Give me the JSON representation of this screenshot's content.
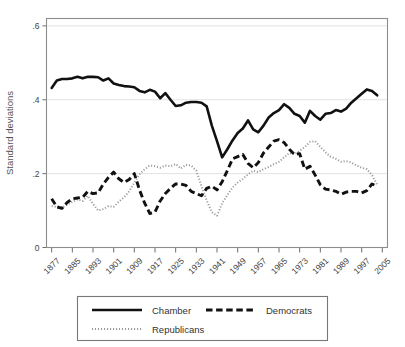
{
  "figure": {
    "width": 405,
    "height": 347,
    "background": "#ffffff"
  },
  "axes": {
    "ylabel": "Standard deviations",
    "xlabel": "",
    "ytick_labels": [
      "0",
      ".2",
      ".4",
      ".6"
    ],
    "ytick_values": [
      0,
      0.2,
      0.4,
      0.6
    ],
    "xtick_labels": [
      "1877",
      "1885",
      "1893",
      "1901",
      "1909",
      "1917",
      "1925",
      "1933",
      "1941",
      "1949",
      "1957",
      "1965",
      "1973",
      "1981",
      "1989",
      "1997",
      "2005"
    ],
    "xtick_values": [
      1877,
      1885,
      1893,
      1901,
      1909,
      1917,
      1925,
      1933,
      1941,
      1949,
      1957,
      1965,
      1973,
      1981,
      1989,
      1997,
      2005
    ],
    "grid": "horizontal",
    "grid_color": "#e2e2e2",
    "frame_color": "#8d8d8d"
  },
  "legend": {
    "position": "below-axes",
    "border_color": "#777777",
    "entries": [
      {
        "label": "Chamber",
        "style": "solid",
        "color": "#111111"
      },
      {
        "label": "Democrats",
        "style": "dashed",
        "color": "#111111"
      },
      {
        "label": "Republicans",
        "style": "dotted",
        "color": "#9a9a9a"
      }
    ]
  },
  "chart_data": {
    "type": "line",
    "title": "",
    "subtitle": "",
    "xlabel": "",
    "ylabel": "Standard deviations",
    "xlim": [
      1875,
      2007
    ],
    "ylim": [
      0,
      0.62
    ],
    "grid": true,
    "legend_position": "bottom",
    "x": [
      1877,
      1879,
      1881,
      1883,
      1885,
      1887,
      1889,
      1891,
      1893,
      1895,
      1897,
      1899,
      1901,
      1903,
      1905,
      1907,
      1909,
      1911,
      1913,
      1915,
      1917,
      1919,
      1921,
      1923,
      1925,
      1927,
      1929,
      1931,
      1933,
      1935,
      1937,
      1939,
      1941,
      1943,
      1945,
      1947,
      1949,
      1951,
      1953,
      1955,
      1957,
      1959,
      1961,
      1963,
      1965,
      1967,
      1969,
      1971,
      1973,
      1975,
      1977,
      1979,
      1981,
      1983,
      1985,
      1987,
      1989,
      1991,
      1993,
      1995,
      1997,
      1999,
      2001,
      2003
    ],
    "series": [
      {
        "name": "Chamber",
        "style": "solid",
        "color": "#111111",
        "values": [
          0.432,
          0.452,
          0.456,
          0.456,
          0.458,
          0.462,
          0.458,
          0.462,
          0.462,
          0.461,
          0.452,
          0.458,
          0.444,
          0.44,
          0.437,
          0.436,
          0.434,
          0.424,
          0.42,
          0.427,
          0.422,
          0.404,
          0.418,
          0.4,
          0.383,
          0.385,
          0.392,
          0.394,
          0.394,
          0.392,
          0.382,
          0.33,
          0.288,
          0.244,
          0.266,
          0.29,
          0.31,
          0.322,
          0.344,
          0.32,
          0.312,
          0.33,
          0.352,
          0.364,
          0.372,
          0.388,
          0.378,
          0.362,
          0.356,
          0.338,
          0.37,
          0.356,
          0.346,
          0.362,
          0.364,
          0.372,
          0.368,
          0.376,
          0.392,
          0.404,
          0.416,
          0.428,
          0.424,
          0.412
        ]
      },
      {
        "name": "Democrats",
        "style": "dashed",
        "color": "#111111",
        "values": [
          0.132,
          0.11,
          0.106,
          0.122,
          0.132,
          0.134,
          0.136,
          0.152,
          0.146,
          0.148,
          0.172,
          0.19,
          0.204,
          0.186,
          0.176,
          0.184,
          0.2,
          0.156,
          0.12,
          0.092,
          0.096,
          0.126,
          0.146,
          0.16,
          0.172,
          0.172,
          0.168,
          0.152,
          0.146,
          0.14,
          0.16,
          0.166,
          0.156,
          0.178,
          0.208,
          0.24,
          0.246,
          0.252,
          0.228,
          0.216,
          0.23,
          0.256,
          0.272,
          0.288,
          0.292,
          0.284,
          0.266,
          0.252,
          0.254,
          0.212,
          0.22,
          0.196,
          0.17,
          0.158,
          0.156,
          0.152,
          0.144,
          0.15,
          0.152,
          0.152,
          0.148,
          0.154,
          0.172,
          0.166
        ]
      },
      {
        "name": "Republicans",
        "style": "dotted",
        "color": "#9a9a9a",
        "values": [
          0.112,
          0.11,
          0.108,
          0.116,
          0.124,
          0.13,
          0.126,
          0.14,
          0.118,
          0.1,
          0.104,
          0.112,
          0.11,
          0.124,
          0.136,
          0.152,
          0.176,
          0.198,
          0.212,
          0.222,
          0.22,
          0.216,
          0.222,
          0.22,
          0.226,
          0.214,
          0.224,
          0.222,
          0.208,
          0.166,
          0.128,
          0.096,
          0.086,
          0.12,
          0.142,
          0.162,
          0.176,
          0.186,
          0.198,
          0.208,
          0.204,
          0.212,
          0.218,
          0.226,
          0.232,
          0.244,
          0.256,
          0.252,
          0.262,
          0.272,
          0.286,
          0.288,
          0.272,
          0.258,
          0.246,
          0.24,
          0.232,
          0.234,
          0.23,
          0.222,
          0.216,
          0.212,
          0.196,
          0.17
        ]
      }
    ]
  }
}
